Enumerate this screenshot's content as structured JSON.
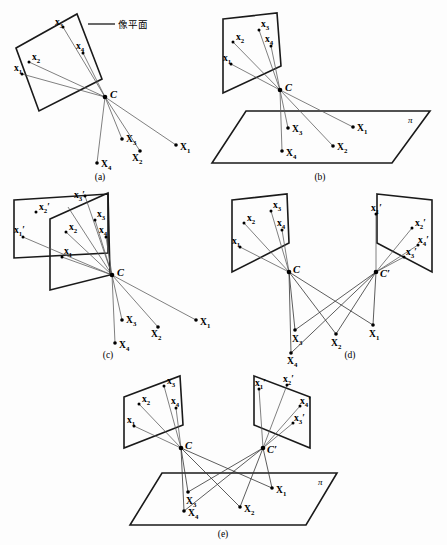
{
  "figure": {
    "background_color": "#fdfdfd",
    "ink_color": "#1a1a1a",
    "ray_color": "#555555",
    "annotations": {
      "image_plane_label": "像平面"
    },
    "captions": {
      "a": "(a)",
      "b": "(b)",
      "c": "(c)",
      "d": "(d)",
      "e": "(e)"
    },
    "labels": {
      "x": "x",
      "X": "X",
      "C": "C",
      "C_prime": "C′",
      "pi": "π",
      "sub1": "1",
      "sub2": "2",
      "sub3": "3",
      "sub4": "4",
      "prime": "′"
    },
    "panels": [
      {
        "id": "a",
        "caption": "(a)",
        "centers": [
          "C"
        ],
        "image_planes": 1,
        "world_plane": false,
        "image_points": [
          "x1",
          "x2",
          "x3",
          "x4"
        ],
        "world_points": [
          "X1",
          "X2",
          "X3",
          "X4"
        ],
        "annotation": "像平面"
      },
      {
        "id": "b",
        "caption": "(b)",
        "centers": [
          "C"
        ],
        "image_planes": 1,
        "world_plane": true,
        "world_plane_label": "π",
        "image_points": [
          "x1",
          "x2",
          "x3",
          "x4"
        ],
        "world_points": [
          "X1",
          "X2",
          "X3",
          "X4"
        ]
      },
      {
        "id": "c",
        "caption": "(c)",
        "centers": [
          "C"
        ],
        "image_planes": 2,
        "world_plane": false,
        "image_points": [
          "x1",
          "x2",
          "x3",
          "x4"
        ],
        "image_points_primed": [
          "x1′",
          "x2′",
          "x3′"
        ],
        "world_points": [
          "X1",
          "X2",
          "X3",
          "X4"
        ]
      },
      {
        "id": "d",
        "caption": "(d)",
        "centers": [
          "C",
          "C′"
        ],
        "image_planes": 2,
        "world_plane": false,
        "image_points": [
          "x1",
          "x2",
          "x3",
          "x4"
        ],
        "image_points_primed": [
          "x1′",
          "x2′",
          "x3′",
          "x4′"
        ],
        "world_points": [
          "X1",
          "X2",
          "X3",
          "X4"
        ]
      },
      {
        "id": "e",
        "caption": "(e)",
        "centers": [
          "C",
          "C′"
        ],
        "image_planes": 2,
        "world_plane": true,
        "world_plane_label": "π",
        "image_points": [
          "x1",
          "x2",
          "x3",
          "x4"
        ],
        "image_points_primed": [
          "x1′",
          "x2′",
          "x3′",
          "x4′"
        ],
        "world_points": [
          "X1",
          "X2",
          "X3",
          "X4"
        ]
      }
    ]
  }
}
